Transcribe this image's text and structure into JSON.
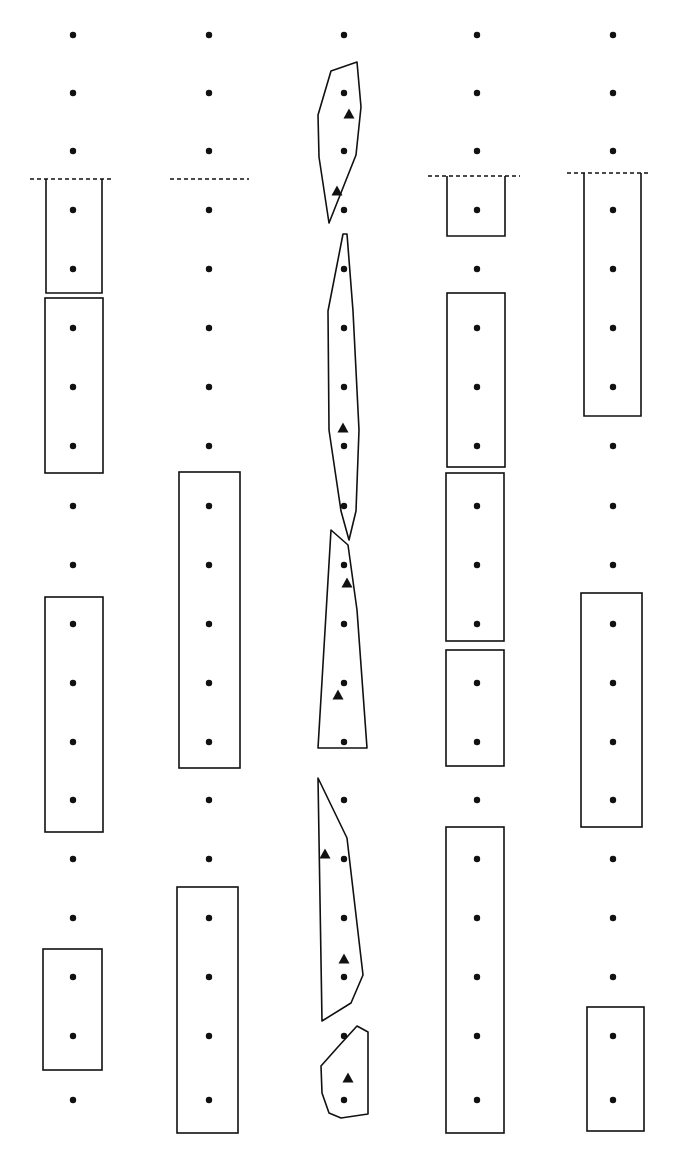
{
  "diagram": {
    "width": 673,
    "height": 1155,
    "colors": {
      "ink": "#111111",
      "background": "#ffffff"
    },
    "row_y": [
      35,
      93,
      151,
      210,
      269,
      328,
      387,
      446,
      506,
      565,
      624,
      683,
      742,
      800,
      859,
      918,
      977,
      1036,
      1100
    ],
    "dashed_lines": [
      {
        "x1": 30,
        "x2": 114,
        "y": 179
      },
      {
        "x1": 170,
        "x2": 249,
        "y": 179
      },
      {
        "x1": 428,
        "x2": 520,
        "y": 176
      },
      {
        "x1": 567,
        "x2": 648,
        "y": 173
      }
    ],
    "columns": [
      {
        "id": "col-1",
        "x": 73,
        "dot_rows": [
          0,
          1,
          2,
          3,
          4,
          5,
          6,
          7,
          8,
          9,
          10,
          11,
          12,
          13,
          14,
          15,
          16,
          17,
          18
        ],
        "boxes": [
          {
            "x": 46,
            "y": 179,
            "w": 56,
            "h": 114,
            "open_top": true
          },
          {
            "x": 45,
            "y": 298,
            "w": 58,
            "h": 175,
            "open_top": false
          },
          {
            "x": 45,
            "y": 597,
            "w": 58,
            "h": 235,
            "open_top": false
          },
          {
            "x": 43,
            "y": 949,
            "w": 59,
            "h": 121,
            "open_top": false
          }
        ]
      },
      {
        "id": "col-2",
        "x": 209,
        "dot_rows": [
          0,
          1,
          2,
          3,
          4,
          5,
          6,
          7,
          8,
          9,
          10,
          11,
          12,
          13,
          14,
          15,
          16,
          17,
          18
        ],
        "boxes": [
          {
            "x": 179,
            "y": 472,
            "w": 61,
            "h": 296,
            "open_top": false
          },
          {
            "x": 177,
            "y": 887,
            "w": 61,
            "h": 246,
            "open_top": false
          }
        ]
      },
      {
        "id": "col-3",
        "x": 344,
        "dot_rows": [
          0,
          1,
          2,
          3,
          4,
          5,
          6,
          7,
          8,
          9,
          10,
          11,
          12,
          13,
          14,
          15,
          16,
          17,
          18
        ],
        "polygons": [
          {
            "points": "331,71 357,62 361,107 356,155 329,223 319,157 318,115"
          },
          {
            "points": "343,234 347,234 353,311 359,430 356,511 349,540 341,511 329,430 328,311"
          },
          {
            "points": "331,530 348,545 357,610 367,748 318,748"
          },
          {
            "points": "318,778 347,838 363,975 351,1003 322,1021"
          },
          {
            "points": "357,1026 368,1032 368,1114 341,1118 329,1113 322,1093 321,1066 337,1048"
          }
        ],
        "triangles": [
          {
            "x": 349,
            "y": 114
          },
          {
            "x": 337,
            "y": 191
          },
          {
            "x": 343,
            "y": 428
          },
          {
            "x": 347,
            "y": 583
          },
          {
            "x": 338,
            "y": 695
          },
          {
            "x": 325,
            "y": 854
          },
          {
            "x": 344,
            "y": 959
          },
          {
            "x": 348,
            "y": 1078
          }
        ]
      },
      {
        "id": "col-4",
        "x": 477,
        "dot_rows": [
          0,
          1,
          2,
          3,
          4,
          5,
          6,
          7,
          8,
          9,
          10,
          11,
          12,
          13,
          14,
          15,
          16,
          17,
          18
        ],
        "boxes": [
          {
            "x": 447,
            "y": 176,
            "w": 58,
            "h": 60,
            "open_top": true
          },
          {
            "x": 447,
            "y": 293,
            "w": 58,
            "h": 174,
            "open_top": false
          },
          {
            "x": 446,
            "y": 473,
            "w": 58,
            "h": 168,
            "open_top": false
          },
          {
            "x": 446,
            "y": 650,
            "w": 58,
            "h": 116,
            "open_top": false
          },
          {
            "x": 446,
            "y": 827,
            "w": 58,
            "h": 306,
            "open_top": false
          }
        ]
      },
      {
        "id": "col-5",
        "x": 613,
        "dot_rows": [
          0,
          1,
          2,
          3,
          4,
          5,
          6,
          7,
          8,
          9,
          10,
          11,
          12,
          13,
          14,
          15,
          16,
          17,
          18
        ],
        "boxes": [
          {
            "x": 584,
            "y": 173,
            "w": 57,
            "h": 243,
            "open_top": true
          },
          {
            "x": 581,
            "y": 593,
            "w": 61,
            "h": 234,
            "open_top": false
          },
          {
            "x": 587,
            "y": 1007,
            "w": 57,
            "h": 124,
            "open_top": false
          }
        ]
      }
    ]
  }
}
